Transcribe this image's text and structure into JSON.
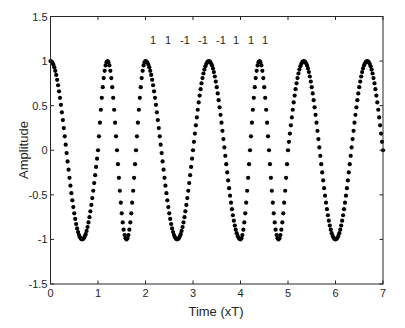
{
  "chart_data": {
    "type": "scatter",
    "title": "",
    "xlabel": "Time (xT)",
    "ylabel": "Amplitude",
    "xlim": [
      0,
      7
    ],
    "ylim": [
      -1.5,
      1.5
    ],
    "xticks": [
      0,
      1,
      2,
      3,
      4,
      5,
      6,
      7
    ],
    "xtick_labels": [
      "0",
      "1",
      "2",
      "3",
      "4",
      "5",
      "6",
      "7"
    ],
    "yticks": [
      1.5,
      1,
      0.5,
      0,
      -0.5,
      -1,
      -1.5
    ],
    "ytick_labels": [
      "1.5",
      "1",
      "0.5",
      "0",
      "-0.5",
      "-1",
      "-1.5"
    ],
    "grid": false,
    "legend": null,
    "marker": "filled-circle",
    "marker_color": "#000000",
    "annotation": {
      "text_items": [
        "1",
        "1",
        "-1",
        "-1",
        "-1",
        "1",
        "1",
        "1"
      ],
      "y": 1.28
    },
    "signal_model": {
      "description": "Continuous-phase FSK: y = cos(phase), phase rate per bit interval in units of pi per T",
      "bit_intervals": [
        [
          0,
          1
        ],
        [
          1,
          2
        ],
        [
          2,
          3
        ],
        [
          3,
          4
        ],
        [
          4,
          5
        ],
        [
          5,
          6
        ],
        [
          6,
          7
        ]
      ],
      "phase_rate_pi_per_T": [
        1.5,
        2.5,
        1.5,
        1.5,
        2.5,
        1.5,
        1.5
      ],
      "samples_per_T": 50
    },
    "series": [
      {
        "name": "signal",
        "maxima_x": [
          0,
          1.2,
          2.0,
          3.33,
          4.4,
          5.33,
          6.67
        ],
        "maxima_y": [
          1,
          1,
          1,
          1,
          1,
          1,
          1
        ],
        "minima_x": [
          0.67,
          1.6,
          2.67,
          4.0,
          4.8,
          6.0
        ],
        "minima_y": [
          -1,
          -1,
          -1,
          -1,
          -1,
          -1
        ],
        "end_point": [
          7,
          0
        ]
      }
    ]
  }
}
